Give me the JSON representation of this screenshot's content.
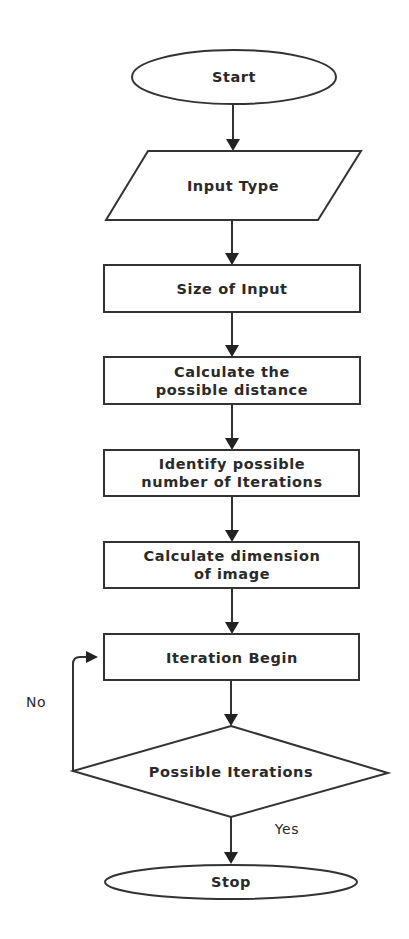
{
  "diagram": {
    "type": "flowchart",
    "colors": {
      "stroke": "#333333",
      "text": "#2a2a2a",
      "background": "#ffffff"
    },
    "nodes": [
      {
        "id": "start",
        "shape": "ellipse",
        "label": "Start"
      },
      {
        "id": "input_type",
        "shape": "parallelogram",
        "label": "Input Type"
      },
      {
        "id": "size_of_input",
        "shape": "rectangle",
        "label": "Size of Input"
      },
      {
        "id": "calc_distance",
        "shape": "rectangle",
        "lines": [
          "Calculate the",
          "possible distance"
        ]
      },
      {
        "id": "identify_iterations",
        "shape": "rectangle",
        "lines": [
          "Identify possible",
          "number of Iterations"
        ]
      },
      {
        "id": "calc_dimension",
        "shape": "rectangle",
        "lines": [
          "Calculate dimension",
          "of image"
        ]
      },
      {
        "id": "iteration_begin",
        "shape": "rectangle",
        "label": "Iteration Begin"
      },
      {
        "id": "possible_iterations",
        "shape": "diamond",
        "label": "Possible Iterations"
      },
      {
        "id": "stop",
        "shape": "ellipse",
        "label": "Stop"
      }
    ],
    "edges": [
      {
        "from": "start",
        "to": "input_type",
        "label": ""
      },
      {
        "from": "input_type",
        "to": "size_of_input",
        "label": ""
      },
      {
        "from": "size_of_input",
        "to": "calc_distance",
        "label": ""
      },
      {
        "from": "calc_distance",
        "to": "identify_iterations",
        "label": ""
      },
      {
        "from": "identify_iterations",
        "to": "calc_dimension",
        "label": ""
      },
      {
        "from": "calc_dimension",
        "to": "iteration_begin",
        "label": ""
      },
      {
        "from": "iteration_begin",
        "to": "possible_iterations",
        "label": ""
      },
      {
        "from": "possible_iterations",
        "to": "iteration_begin",
        "label": "No"
      },
      {
        "from": "possible_iterations",
        "to": "stop",
        "label": "Yes"
      }
    ],
    "edge_labels": {
      "no": "No",
      "yes": "Yes"
    }
  }
}
